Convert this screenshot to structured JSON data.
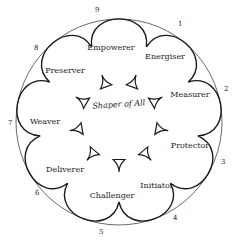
{
  "diagram": {
    "center_label": "Shaper of All",
    "roles": [
      {
        "label": "Energiser"
      },
      {
        "label": "Measurer"
      },
      {
        "label": "Protector"
      },
      {
        "label": "Initiator"
      },
      {
        "label": "Challenger"
      },
      {
        "label": "Deliverer"
      },
      {
        "label": "Weaver"
      },
      {
        "label": "Preserver"
      },
      {
        "label": "Empowerer"
      }
    ],
    "numbers": [
      "1",
      "2",
      "3",
      "4",
      "5",
      "6",
      "7",
      "8",
      "9"
    ],
    "colors": {
      "line": "#1a1a1a",
      "background": "#ffffff"
    }
  }
}
